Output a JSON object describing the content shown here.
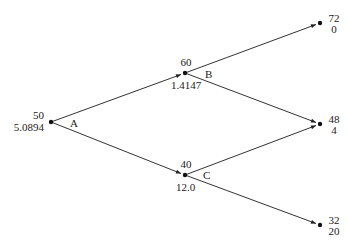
{
  "diagram": {
    "type": "binomial-tree",
    "colors": {
      "line": "#333333",
      "node": "#111111",
      "text": "#222222"
    },
    "nodes": {
      "A": {
        "name": "A",
        "price": "50",
        "value": "5.0894"
      },
      "B": {
        "name": "B",
        "price": "60",
        "value": "1.4147"
      },
      "C": {
        "name": "C",
        "price": "40",
        "value": "12.0"
      },
      "UU": {
        "price": "72",
        "value": "0"
      },
      "UD": {
        "price": "48",
        "value": "4"
      },
      "DD": {
        "price": "32",
        "value": "20"
      }
    },
    "edges": [
      {
        "from": "A",
        "to": "B"
      },
      {
        "from": "A",
        "to": "C"
      },
      {
        "from": "B",
        "to": "UU"
      },
      {
        "from": "B",
        "to": "UD"
      },
      {
        "from": "C",
        "to": "UD"
      },
      {
        "from": "C",
        "to": "DD"
      }
    ]
  }
}
